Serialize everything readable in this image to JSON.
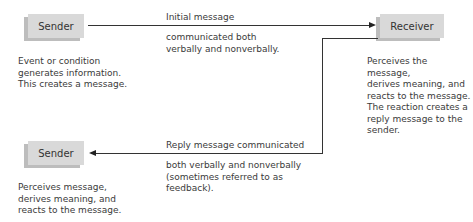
{
  "nodes": {
    "sender_top": {
      "label": "Sender",
      "description": [
        "Event or condition",
        "generates information.",
        "This creates a message."
      ]
    },
    "receiver": {
      "label": "Receiver",
      "description": [
        "Perceives the message,",
        "derives meaning, and",
        "reacts to the message.",
        "The reaction creates a",
        "reply message to the",
        "sender."
      ]
    },
    "sender_bottom": {
      "label": "Sender",
      "description": [
        "Perceives message,",
        "derives meaning, and",
        "reacts to the message."
      ]
    }
  },
  "edges": {
    "initial": {
      "title": "Initial message",
      "detail": [
        "communicated both",
        "verbally and nonverbally."
      ]
    },
    "reply": {
      "title": "Reply message communicated",
      "detail": [
        "both verbally and nonverbally",
        "(sometimes referred to as",
        "feedback)."
      ]
    }
  },
  "colors": {
    "box_fill": "#d9d9d9",
    "box_shadow": "#bdbdbd",
    "line": "#333333"
  }
}
